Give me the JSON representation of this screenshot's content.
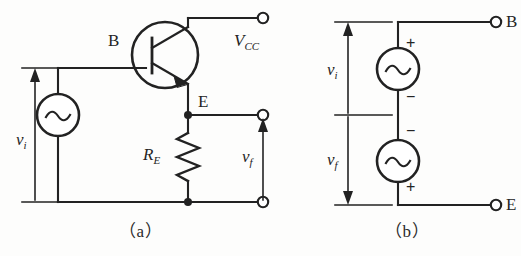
{
  "figure": {
    "title_caption_a": "（a）",
    "title_caption_b": "（b）",
    "background_color": "#fdfdfc",
    "line_color": "#222222",
    "text_color": "#242424"
  },
  "panel_a": {
    "caption": "（a）",
    "labels": {
      "base": "B",
      "emitter": "E",
      "supply": "V",
      "supply_sub": "CC",
      "resistor": "R",
      "resistor_sub": "E",
      "input_voltage": "v",
      "input_voltage_sub": "i",
      "feedback_voltage": "v",
      "feedback_voltage_sub": "f"
    },
    "components": {
      "transistor_type": "npn-bipolar-junction-transistor",
      "source_type": "ac-voltage-source",
      "resistor_type": "zigzag-resistor"
    }
  },
  "panel_b": {
    "caption": "（b）",
    "labels": {
      "terminal_base": "B",
      "terminal_emitter": "E",
      "input_voltage": "v",
      "input_voltage_sub": "i",
      "feedback_voltage": "v",
      "feedback_voltage_sub": "f",
      "source_top_plus": "+",
      "source_top_minus": "−",
      "source_bottom_minus": "−",
      "source_bottom_plus": "+"
    },
    "components": {
      "source_top_type": "ac-voltage-source",
      "source_bottom_type": "ac-voltage-source"
    }
  }
}
